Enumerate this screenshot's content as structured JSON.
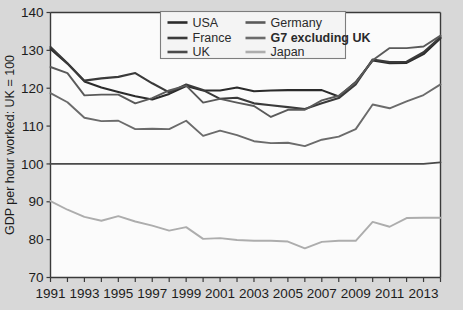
{
  "chart_data": {
    "type": "line",
    "title": "",
    "xlabel": "",
    "ylabel": "GDP per hour worked: UK = 100",
    "ylim": [
      70,
      140
    ],
    "yticks": [
      70,
      80,
      90,
      100,
      110,
      120,
      130,
      140
    ],
    "ytick_labels": [
      "70",
      "80",
      "90",
      "100",
      "110",
      "120",
      "130",
      "140"
    ],
    "xlim": [
      1991,
      2014
    ],
    "x": [
      1991,
      1992,
      1993,
      1994,
      1995,
      1996,
      1997,
      1998,
      1999,
      2000,
      2001,
      2002,
      2003,
      2004,
      2005,
      2006,
      2007,
      2008,
      2009,
      2010,
      2011,
      2012,
      2013,
      2014
    ],
    "xticks": [
      1991,
      1992,
      1993,
      1994,
      1995,
      1996,
      1997,
      1998,
      1999,
      2000,
      2001,
      2002,
      2003,
      2004,
      2005,
      2006,
      2007,
      2008,
      2009,
      2010,
      2011,
      2012,
      2013,
      2014
    ],
    "xtick_labels": [
      "1991",
      "",
      "1993",
      "",
      "1995",
      "",
      "1997",
      "",
      "1999",
      "",
      "2001",
      "",
      "2003",
      "",
      "2005",
      "",
      "2007",
      "",
      "2009",
      "",
      "2011",
      "",
      "2013",
      ""
    ],
    "grid": false,
    "legend_position": "top-center",
    "legend_columns": 2,
    "series": [
      {
        "name": "USA",
        "color": "#2b2b2b",
        "width": 2.1,
        "values": [
          130.4,
          126.5,
          121.8,
          120.2,
          119.0,
          117.9,
          117.0,
          118.5,
          120.6,
          119.4,
          119.4,
          120.2,
          119.2,
          119.4,
          119.5,
          119.5,
          119.5,
          117.8,
          121.6,
          127.3,
          126.6,
          126.7,
          129.0,
          133.2
        ]
      },
      {
        "name": "France",
        "color": "#3a3a3a",
        "width": 2.1,
        "values": [
          130.9,
          126.6,
          122.0,
          122.6,
          123.0,
          124.0,
          121.3,
          118.9,
          121.0,
          119.5,
          117.2,
          117.5,
          116.0,
          115.5,
          115.0,
          114.5,
          116.0,
          117.4,
          121.0,
          127.6,
          126.9,
          127.0,
          129.5,
          133.5
        ]
      },
      {
        "name": "UK",
        "color": "#4a4a4a",
        "width": 1.8,
        "values": [
          100,
          100,
          100,
          100,
          100,
          100,
          100,
          100,
          100,
          100,
          100,
          100,
          100,
          100,
          100,
          100,
          100,
          100,
          100,
          100,
          100,
          100,
          100,
          100.4
        ]
      },
      {
        "name": "Germany",
        "color": "#5a5a5a",
        "width": 1.9,
        "values": [
          125.6,
          124.0,
          118.1,
          118.3,
          118.3,
          116.0,
          117.4,
          119.4,
          120.7,
          116.2,
          117.2,
          116.2,
          115.3,
          112.4,
          114.3,
          114.3,
          116.8,
          118.0,
          121.5,
          127.4,
          130.6,
          130.6,
          131.0,
          133.9
        ]
      },
      {
        "name": "G7 excluding UK",
        "color": "#6b6b6b",
        "width": 1.9,
        "values": [
          118.7,
          116.3,
          112.2,
          111.3,
          111.4,
          109.2,
          109.3,
          109.2,
          111.4,
          107.4,
          108.8,
          107.6,
          106.0,
          105.5,
          105.6,
          104.7,
          106.4,
          107.2,
          109.2,
          115.7,
          114.7,
          116.5,
          118.2,
          121.0
        ]
      },
      {
        "name": "Japan",
        "color": "#adadad",
        "width": 1.9,
        "values": [
          90.2,
          87.9,
          86.0,
          85.0,
          86.2,
          84.8,
          83.7,
          82.4,
          83.3,
          80.2,
          80.4,
          79.9,
          79.7,
          79.7,
          79.5,
          77.7,
          79.4,
          79.7,
          79.7,
          84.7,
          83.4,
          85.7,
          85.8,
          85.8
        ]
      }
    ]
  },
  "legend": {
    "entries": [
      {
        "label": "USA"
      },
      {
        "label": "Germany"
      },
      {
        "label": "France"
      },
      {
        "label": "G7 excluding UK"
      },
      {
        "label": "UK"
      },
      {
        "label": "Japan"
      }
    ]
  },
  "colors": {
    "background": "#d8d8d8",
    "plot_background": "#fbfbfb",
    "axis": "#3a3a3a",
    "legend_border": "#7d7d7d"
  }
}
